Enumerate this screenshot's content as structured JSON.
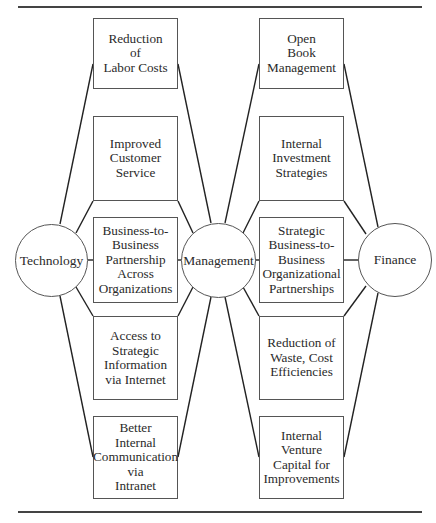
{
  "diagram": {
    "title_partial": "",
    "nodes": {
      "technology": {
        "label": "Technology"
      },
      "management": {
        "label": "Management"
      },
      "finance": {
        "label": "Finance"
      }
    },
    "left_boxes": [
      {
        "label": "Reduction\nof\nLabor Costs"
      },
      {
        "label": "Improved\nCustomer\nService"
      },
      {
        "label": "Business-to-\nBusiness\nPartnership\nAcross\nOrganizations"
      },
      {
        "label": "Access to\nStrategic\nInformation\nvia Internet"
      },
      {
        "label": "Better\nInternal\nCommunication\nvia\nIntranet"
      }
    ],
    "right_boxes": [
      {
        "label": "Open\nBook\nManagement"
      },
      {
        "label": "Internal\nInvestment\nStrategies"
      },
      {
        "label": "Strategic\nBusiness-to-\nBusiness\nOrganizational\nPartnerships"
      },
      {
        "label": "Reduction of\nWaste, Cost\nEfficiencies"
      },
      {
        "label": "Internal\nVenture\nCapital for\nImprovements"
      }
    ],
    "edges": [
      "Technology-Reduction of Labor Costs",
      "Technology-Improved Customer Service",
      "Technology-Business-to-Business Partnership Across Organizations",
      "Technology-Access to Strategic Information via Internet",
      "Technology-Better Internal Communication via Intranet",
      "Management-(all left boxes)",
      "Management-(all right boxes)",
      "Finance-(all right boxes)"
    ]
  }
}
